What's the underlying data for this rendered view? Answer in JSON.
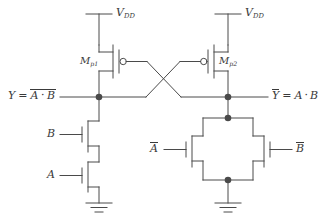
{
  "diagram": {
    "stroke_color": "#4a4a4a",
    "text_color": "#3a3a3a",
    "background": "#ffffff"
  },
  "supplies": {
    "left": {
      "label_v": "V",
      "label_sub": "DD",
      "name": "VDD"
    },
    "right": {
      "label_v": "V",
      "label_sub": "DD",
      "name": "VDD"
    }
  },
  "pmos": {
    "left": {
      "label_m": "M",
      "label_sub": "p1",
      "name": "Mp1"
    },
    "right": {
      "label_m": "M",
      "label_sub": "p2",
      "name": "Mp2"
    }
  },
  "outputs": {
    "left": {
      "var": "Y",
      "eq": "=",
      "expr_a": "A",
      "dot": "·",
      "expr_b": "B",
      "overline_scope": "expression"
    },
    "right": {
      "var": "Y",
      "eq": "=",
      "expr_a": "A",
      "dot": "·",
      "expr_b": "B",
      "overline_scope": "variable"
    }
  },
  "nmos_left_stack": {
    "top": {
      "label": "B",
      "overline": false
    },
    "bottom": {
      "label": "A",
      "overline": false
    }
  },
  "nmos_right_parallel": {
    "left": {
      "label": "A",
      "overline": true
    },
    "right": {
      "label": "B",
      "overline": true
    }
  },
  "grounds": {
    "left": {
      "name": "ground-left"
    },
    "right": {
      "name": "ground-right"
    }
  }
}
